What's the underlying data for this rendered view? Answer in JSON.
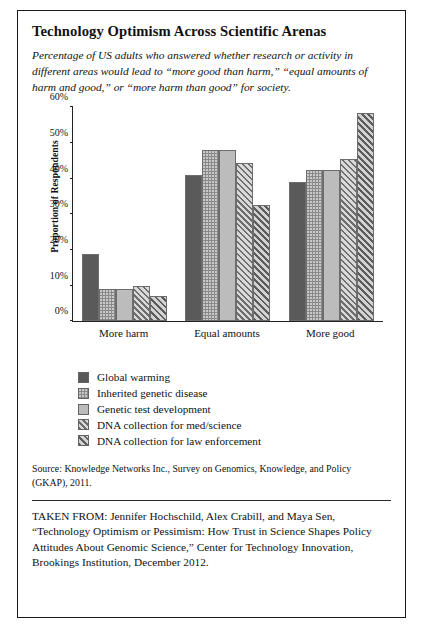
{
  "figure": {
    "title": "Technology Optimism Across Scientific Arenas",
    "subtitle": "Percentage of US adults who answered whether research or activity in different areas would lead to “more good than harm,” “equal amounts of harm and good,” or “more harm than good” for society.",
    "source_note": "Source: Knowledge Networks Inc., Survey on Genomics, Knowledge, and Policy (GKAP), 2011.",
    "taken_from": "TAKEN FROM: Jennifer Hochschild, Alex Crabill, and Maya Sen, “Technology Optimism or Pessimism: How Trust in Science Shapes Policy Attitudes About Genomic Science,” Center for Technology Innovation, Brookings Institution, December 2012."
  },
  "chart_data": {
    "type": "bar",
    "title": "Technology Optimism Across Scientific Arenas",
    "xlabel": "",
    "ylabel": "Proportion of Respondents",
    "ylim": [
      0,
      60
    ],
    "ytick_labels": [
      "0%",
      "10%",
      "20%",
      "30%",
      "40%",
      "50%",
      "60%"
    ],
    "ytick_values": [
      0,
      10,
      20,
      30,
      40,
      50,
      60
    ],
    "grid": false,
    "legend_position": "below-plot",
    "categories": [
      "More harm",
      "Equal amounts",
      "More good"
    ],
    "series": [
      {
        "name": "Global warming",
        "values": [
          19,
          41,
          39
        ],
        "fill": "solid-dark",
        "color": "#5a5a5a"
      },
      {
        "name": "Inherited genetic disease",
        "values": [
          9,
          48,
          42.5
        ],
        "fill": "dotted-medium",
        "color": "#8a8a8a"
      },
      {
        "name": "Genetic test development",
        "values": [
          9,
          48,
          42.5
        ],
        "fill": "solid-light",
        "color": "#bcbcbc"
      },
      {
        "name": "DNA collection for med/science",
        "values": [
          9.8,
          44.5,
          45.5
        ],
        "fill": "diagonal-hatch-light",
        "color": "#d5d5d5"
      },
      {
        "name": "DNA collection for law enforcement",
        "values": [
          7,
          32.5,
          58.5
        ],
        "fill": "diagonal-hatch-dark",
        "color": "#c9c9c9"
      }
    ]
  }
}
